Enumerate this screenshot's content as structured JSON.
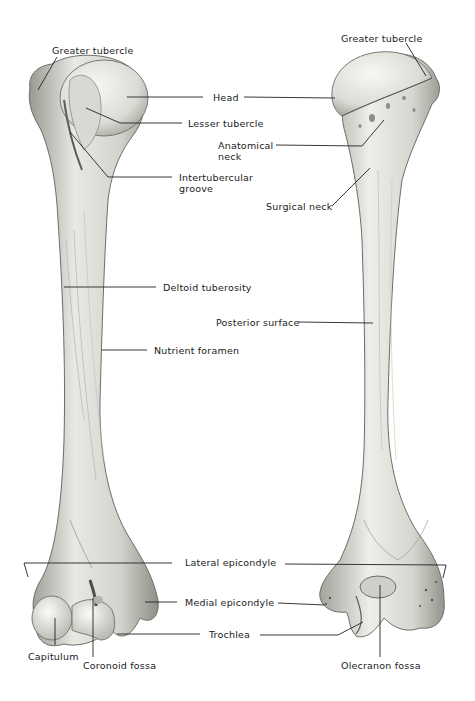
{
  "figure": {
    "views": [
      {
        "name": "anterior",
        "side": "left"
      },
      {
        "name": "posterior",
        "side": "right"
      }
    ],
    "colors": {
      "background": "#ffffff",
      "bone_light": "#eeeeea",
      "bone_mid": "#c9c9c3",
      "bone_shadow": "#8d8d86",
      "line": "#222222",
      "text": "#1a1a1a"
    }
  },
  "labels": [
    {
      "id": "greater-tubercle-left",
      "text": "Greater tubercle",
      "x": 52,
      "y": 45
    },
    {
      "id": "head",
      "text": "Head",
      "x": 213,
      "y": 93
    },
    {
      "id": "lesser-tubercle",
      "text": "Lesser tubercle",
      "x": 188,
      "y": 119
    },
    {
      "id": "anatomical-neck",
      "text": "Anatomical\nneck",
      "x": 218,
      "y": 141
    },
    {
      "id": "intertubercular-groove",
      "text": "Intertubercular\ngroove",
      "x": 179,
      "y": 174
    },
    {
      "id": "greater-tubercle-right",
      "text": "Greater tubercle",
      "x": 341,
      "y": 33
    },
    {
      "id": "surgical-neck",
      "text": "Surgical neck",
      "x": 266,
      "y": 201
    },
    {
      "id": "deltoid-tuberosity",
      "text": "Deltoid tuberosity",
      "x": 163,
      "y": 283
    },
    {
      "id": "posterior-surface",
      "text": "Posterior surface",
      "x": 216,
      "y": 317
    },
    {
      "id": "nutrient-foramen",
      "text": "Nutrient foramen",
      "x": 154,
      "y": 346
    },
    {
      "id": "lateral-epicondyle",
      "text": "Lateral epicondyle",
      "x": 185,
      "y": 558
    },
    {
      "id": "medial-epicondyle",
      "text": "Medial epicondyle",
      "x": 185,
      "y": 598
    },
    {
      "id": "trochlea",
      "text": "Trochlea",
      "x": 209,
      "y": 630
    },
    {
      "id": "capitulum",
      "text": "Capitulum",
      "x": 28,
      "y": 652
    },
    {
      "id": "coronoid-fossa",
      "text": "Coronoid fossa",
      "x": 83,
      "y": 661
    },
    {
      "id": "olecranon-fossa",
      "text": "Olecranon fossa",
      "x": 341,
      "y": 661
    }
  ]
}
